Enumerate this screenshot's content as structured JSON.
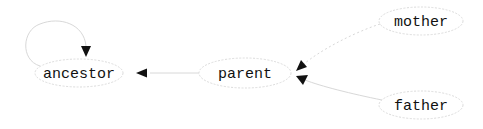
{
  "diagram": {
    "type": "directed-graph",
    "nodes": [
      {
        "id": "ancestor",
        "label": "ancestor"
      },
      {
        "id": "parent",
        "label": "parent"
      },
      {
        "id": "mother",
        "label": "mother"
      },
      {
        "id": "father",
        "label": "father"
      }
    ],
    "edges": [
      {
        "from": "ancestor",
        "to": "ancestor",
        "style": "solid",
        "kind": "self-loop"
      },
      {
        "from": "parent",
        "to": "ancestor",
        "style": "solid"
      },
      {
        "from": "mother",
        "to": "parent",
        "style": "dotted"
      },
      {
        "from": "father",
        "to": "parent",
        "style": "solid"
      }
    ],
    "colors": {
      "node_border": "#dcdcdc",
      "edge": "#d8d8d8",
      "arrowhead": "#111111",
      "text": "#111111",
      "background": "#ffffff"
    }
  }
}
